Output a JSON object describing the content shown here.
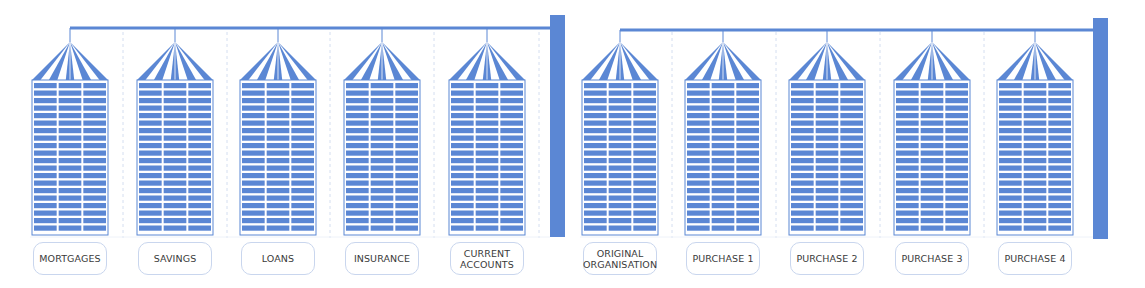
{
  "colors": {
    "silo": "#5b87d4",
    "silo_light": "#e9eff9",
    "bar": "#5b87d4",
    "divider": "#d4def0",
    "label_border": "#c9d6ee",
    "label_text": "#3a3a3a"
  },
  "groups": [
    {
      "name": "business-lines",
      "silos": [
        {
          "label": "MORTGAGES"
        },
        {
          "label": "SAVINGS"
        },
        {
          "label": "LOANS"
        },
        {
          "label": "INSURANCE"
        },
        {
          "label": "CURRENT\nACCOUNTS"
        }
      ]
    },
    {
      "name": "acquisitions",
      "silos": [
        {
          "label": "ORIGINAL\nORGANISATION"
        },
        {
          "label": "PURCHASE 1"
        },
        {
          "label": "PURCHASE 2"
        },
        {
          "label": "PURCHASE 3"
        },
        {
          "label": "PURCHASE 4"
        }
      ]
    }
  ]
}
